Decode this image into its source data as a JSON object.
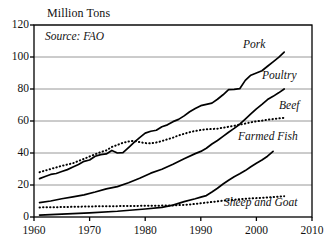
{
  "chart_data": {
    "type": "line",
    "title": "",
    "ylabel": "Million Tons",
    "xlabel": "",
    "source_note": "Source: FAO",
    "xlim": [
      1960,
      2010
    ],
    "ylim": [
      0,
      120
    ],
    "xticks": [
      "1960",
      "1970",
      "1980",
      "1990",
      "2000",
      "2010"
    ],
    "xtick_values": [
      1960,
      1970,
      1980,
      1990,
      2000,
      2010
    ],
    "yticks": [
      "0",
      "20",
      "40",
      "60",
      "80",
      "100",
      "120"
    ],
    "ytick_values": [
      0,
      20,
      40,
      60,
      80,
      100,
      120
    ],
    "grid": "horizontal",
    "legend_position": "inline-end-of-line",
    "series": [
      {
        "name": "Pork",
        "style": "solid",
        "color": "#000000",
        "label_x": 1998,
        "label_y": 108,
        "points": [
          [
            1961,
            24.0
          ],
          [
            1962,
            25.3
          ],
          [
            1963,
            26.6
          ],
          [
            1964,
            27.2
          ],
          [
            1965,
            28.4
          ],
          [
            1966,
            29.6
          ],
          [
            1967,
            31.2
          ],
          [
            1968,
            32.8
          ],
          [
            1969,
            34.8
          ],
          [
            1970,
            35.6
          ],
          [
            1971,
            38.0
          ],
          [
            1972,
            39.0
          ],
          [
            1973,
            39.4
          ],
          [
            1974,
            41.6
          ],
          [
            1975,
            40.0
          ],
          [
            1976,
            40.2
          ],
          [
            1977,
            43.4
          ],
          [
            1978,
            46.6
          ],
          [
            1979,
            49.6
          ],
          [
            1980,
            52.4
          ],
          [
            1981,
            53.6
          ],
          [
            1982,
            54.2
          ],
          [
            1983,
            56.4
          ],
          [
            1984,
            57.6
          ],
          [
            1985,
            59.6
          ],
          [
            1986,
            61.0
          ],
          [
            1987,
            63.2
          ],
          [
            1988,
            65.8
          ],
          [
            1989,
            67.8
          ],
          [
            1990,
            69.6
          ],
          [
            1991,
            70.4
          ],
          [
            1992,
            71.2
          ],
          [
            1993,
            73.6
          ],
          [
            1994,
            76.4
          ],
          [
            1995,
            79.6
          ],
          [
            1996,
            79.8
          ],
          [
            1997,
            80.2
          ],
          [
            1998,
            85.4
          ],
          [
            1999,
            88.6
          ],
          [
            2000,
            90.0
          ],
          [
            2001,
            91.4
          ],
          [
            2002,
            94.2
          ],
          [
            2003,
            97.0
          ],
          [
            2004,
            99.8
          ],
          [
            2005,
            103.0
          ]
        ]
      },
      {
        "name": "Poultry",
        "style": "solid",
        "color": "#000000",
        "label_x": 2000,
        "label_y": 86,
        "points": [
          [
            1961,
            9.0
          ],
          [
            1963,
            10.0
          ],
          [
            1965,
            11.4
          ],
          [
            1967,
            12.6
          ],
          [
            1969,
            13.8
          ],
          [
            1971,
            15.6
          ],
          [
            1973,
            17.6
          ],
          [
            1975,
            19.0
          ],
          [
            1977,
            21.4
          ],
          [
            1979,
            24.2
          ],
          [
            1981,
            27.4
          ],
          [
            1983,
            29.8
          ],
          [
            1985,
            33.0
          ],
          [
            1987,
            36.4
          ],
          [
            1989,
            39.6
          ],
          [
            1990,
            41.0
          ],
          [
            1991,
            43.0
          ],
          [
            1992,
            45.6
          ],
          [
            1993,
            47.8
          ],
          [
            1994,
            50.4
          ],
          [
            1995,
            53.0
          ],
          [
            1996,
            55.4
          ],
          [
            1997,
            58.0
          ],
          [
            1998,
            61.2
          ],
          [
            1999,
            64.4
          ],
          [
            2000,
            67.6
          ],
          [
            2001,
            70.4
          ],
          [
            2002,
            73.4
          ],
          [
            2003,
            75.4
          ],
          [
            2004,
            77.6
          ],
          [
            2005,
            80.0
          ]
        ]
      },
      {
        "name": "Beef",
        "style": "dotted",
        "color": "#000000",
        "label_x": 2001,
        "label_y": 67,
        "points": [
          [
            1961,
            28.0
          ],
          [
            1963,
            30.0
          ],
          [
            1965,
            32.0
          ],
          [
            1967,
            33.6
          ],
          [
            1969,
            36.4
          ],
          [
            1971,
            39.2
          ],
          [
            1972,
            40.6
          ],
          [
            1973,
            41.6
          ],
          [
            1974,
            43.8
          ],
          [
            1975,
            45.0
          ],
          [
            1976,
            46.4
          ],
          [
            1977,
            47.2
          ],
          [
            1978,
            47.6
          ],
          [
            1979,
            46.8
          ],
          [
            1980,
            46.2
          ],
          [
            1981,
            46.0
          ],
          [
            1982,
            46.6
          ],
          [
            1983,
            47.4
          ],
          [
            1984,
            48.6
          ],
          [
            1985,
            49.6
          ],
          [
            1986,
            51.0
          ],
          [
            1987,
            52.0
          ],
          [
            1988,
            53.0
          ],
          [
            1989,
            53.8
          ],
          [
            1990,
            54.4
          ],
          [
            1991,
            54.8
          ],
          [
            1992,
            55.0
          ],
          [
            1993,
            55.2
          ],
          [
            1994,
            55.8
          ],
          [
            1995,
            56.4
          ],
          [
            1996,
            57.0
          ],
          [
            1997,
            57.8
          ],
          [
            1998,
            58.4
          ],
          [
            1999,
            59.2
          ],
          [
            2000,
            59.8
          ],
          [
            2001,
            60.2
          ],
          [
            2002,
            60.8
          ],
          [
            2003,
            61.2
          ],
          [
            2004,
            61.6
          ],
          [
            2005,
            62.0
          ]
        ]
      },
      {
        "name": "Farmed Fish",
        "style": "solid",
        "color": "#000000",
        "label_x": 1994,
        "label_y": 47,
        "points": [
          [
            1961,
            1.2
          ],
          [
            1965,
            1.8
          ],
          [
            1970,
            2.6
          ],
          [
            1975,
            3.6
          ],
          [
            1980,
            5.0
          ],
          [
            1983,
            6.0
          ],
          [
            1985,
            7.4
          ],
          [
            1987,
            9.6
          ],
          [
            1989,
            11.4
          ],
          [
            1990,
            12.4
          ],
          [
            1991,
            13.4
          ],
          [
            1992,
            15.6
          ],
          [
            1993,
            18.0
          ],
          [
            1994,
            20.6
          ],
          [
            1995,
            23.0
          ],
          [
            1996,
            25.2
          ],
          [
            1997,
            27.0
          ],
          [
            1998,
            29.0
          ],
          [
            1999,
            31.4
          ],
          [
            2000,
            33.6
          ],
          [
            2001,
            35.6
          ],
          [
            2002,
            38.0
          ],
          [
            2003,
            41.0
          ]
        ]
      },
      {
        "name": "Sheep and Goat",
        "style": "dotted",
        "color": "#000000",
        "label_x": 1992,
        "label_y": 4,
        "points": [
          [
            1961,
            6.0
          ],
          [
            1965,
            6.2
          ],
          [
            1970,
            6.6
          ],
          [
            1975,
            6.8
          ],
          [
            1980,
            7.0
          ],
          [
            1985,
            7.2
          ],
          [
            1988,
            7.8
          ],
          [
            1990,
            8.6
          ],
          [
            1992,
            9.4
          ],
          [
            1994,
            10.2
          ],
          [
            1996,
            10.8
          ],
          [
            1998,
            11.4
          ],
          [
            2000,
            11.8
          ],
          [
            2002,
            12.2
          ],
          [
            2005,
            13.0
          ]
        ]
      }
    ]
  },
  "geometry": {
    "plot_left": 34,
    "plot_right": 312,
    "plot_top": 25,
    "plot_bottom": 217
  }
}
